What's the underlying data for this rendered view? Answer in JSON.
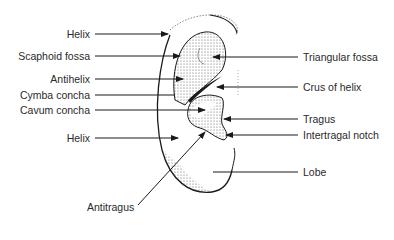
{
  "figure": {
    "type": "anatomical-diagram",
    "colors": {
      "line": "#1a1a1a",
      "stipple": "#555555",
      "background": "#ffffff"
    }
  },
  "labels_left": [
    {
      "id": "helix-upper",
      "text": "Helix",
      "y": 34
    },
    {
      "id": "scaphoid-fossa",
      "text": "Scaphoid fossa",
      "y": 56
    },
    {
      "id": "antihelix",
      "text": "Antihelix",
      "y": 79
    },
    {
      "id": "cymba-concha",
      "text": "Cymba concha",
      "y": 95
    },
    {
      "id": "cavum-concha",
      "text": "Cavum concha",
      "y": 110
    },
    {
      "id": "helix-lower",
      "text": "Helix",
      "y": 138
    }
  ],
  "labels_right": [
    {
      "id": "triangular-fossa",
      "text": "Triangular fossa",
      "y": 57
    },
    {
      "id": "crus-of-helix",
      "text": "Crus of helix",
      "y": 87
    },
    {
      "id": "tragus",
      "text": "Tragus",
      "y": 119
    },
    {
      "id": "intertragal-notch",
      "text": "Intertragal notch",
      "y": 135
    },
    {
      "id": "lobe",
      "text": "Lobe",
      "y": 172
    }
  ],
  "labels_bottom": [
    {
      "id": "antitragus",
      "text": "Antitragus"
    }
  ]
}
